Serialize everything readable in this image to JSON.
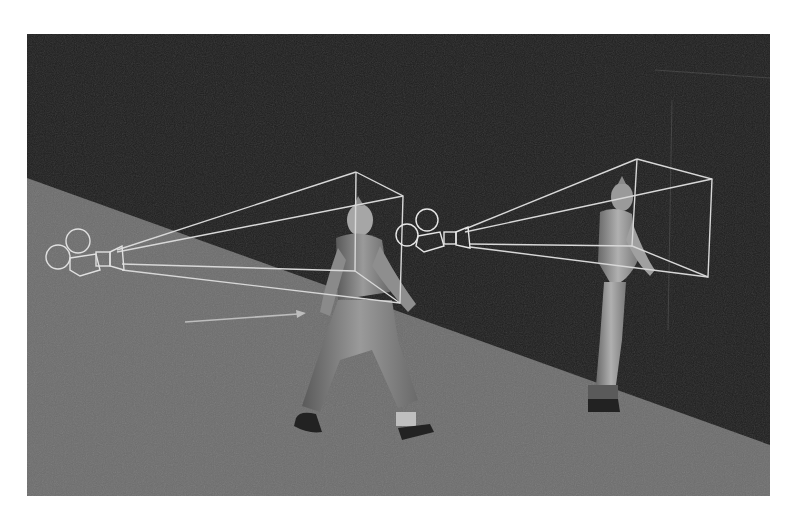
{
  "scene": {
    "description": "3D render of two walking characters each followed by a camera with a wireframe view frustum",
    "colors": {
      "page_bg": "#ffffff",
      "wall": "#1e1e1e",
      "floor": "#6d6d6d",
      "wireframe": "#d8d8d8",
      "character_light": "#a8a8a8",
      "character_dark": "#3a3a3a",
      "shoe": "#222222"
    },
    "viewport": {
      "x": 27,
      "y": 34,
      "width": 743,
      "height": 462
    },
    "cameras": [
      {
        "id": "camera-1",
        "position": [
          110,
          262
        ]
      },
      {
        "id": "camera-2",
        "position": [
          440,
          238
        ]
      }
    ],
    "characters": [
      {
        "id": "character-1",
        "position": [
          360,
          320
        ]
      },
      {
        "id": "character-2",
        "position": [
          610,
          300
        ]
      }
    ],
    "arrow": {
      "from": [
        185,
        322
      ],
      "to": [
        305,
        313
      ]
    }
  }
}
